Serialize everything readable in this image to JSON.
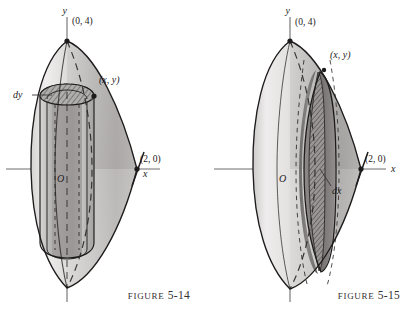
{
  "page": {
    "background_color": "#ffffff",
    "ink_color": "#1d1b1b",
    "width": 416,
    "height": 317
  },
  "figures": [
    {
      "id": "figure-5-14",
      "caption_word": "Figure",
      "caption_number": "5-14",
      "description": "Solid of revolution about the y-axis with an inscribed cylindrical shell element of thickness dy",
      "method": "cylindrical-shells",
      "element_label": "dy",
      "axis_labels": {
        "y": "y",
        "x": "x",
        "origin": "O"
      },
      "points": [
        {
          "name": "vertex-top",
          "label": "(0, 4)"
        },
        {
          "name": "shell-corner",
          "label": "(x, y)"
        },
        {
          "name": "x-intercept",
          "label": "(2, 0)"
        }
      ],
      "colors": {
        "body_light": "#eceaea",
        "body_mid": "#c9c6c6",
        "body_dark": "#9c9898",
        "shell_face": "#a9a5a5",
        "hatch": "#5d5a5a",
        "outline": "#1d1b1b",
        "axis": "#6f6c6c"
      }
    },
    {
      "id": "figure-5-15",
      "caption_word": "Figure",
      "caption_number": "5-15",
      "description": "Solid of revolution about the y-axis with a thin vertical disk element of thickness dx",
      "method": "disks",
      "element_label": "dx",
      "axis_labels": {
        "y": "y",
        "x": "x",
        "origin": "O"
      },
      "points": [
        {
          "name": "vertex-top",
          "label": "(0, 4)"
        },
        {
          "name": "disk-corner",
          "label": "(x, y)"
        },
        {
          "name": "x-intercept",
          "label": "(2, 0)"
        }
      ],
      "colors": {
        "body_light": "#eceaea",
        "body_mid": "#c9c6c6",
        "body_dark": "#8e8a8a",
        "disk_face": "#8b8787",
        "hatch": "#4a4747",
        "outline": "#1d1b1b",
        "axis": "#6f6c6c"
      }
    }
  ]
}
